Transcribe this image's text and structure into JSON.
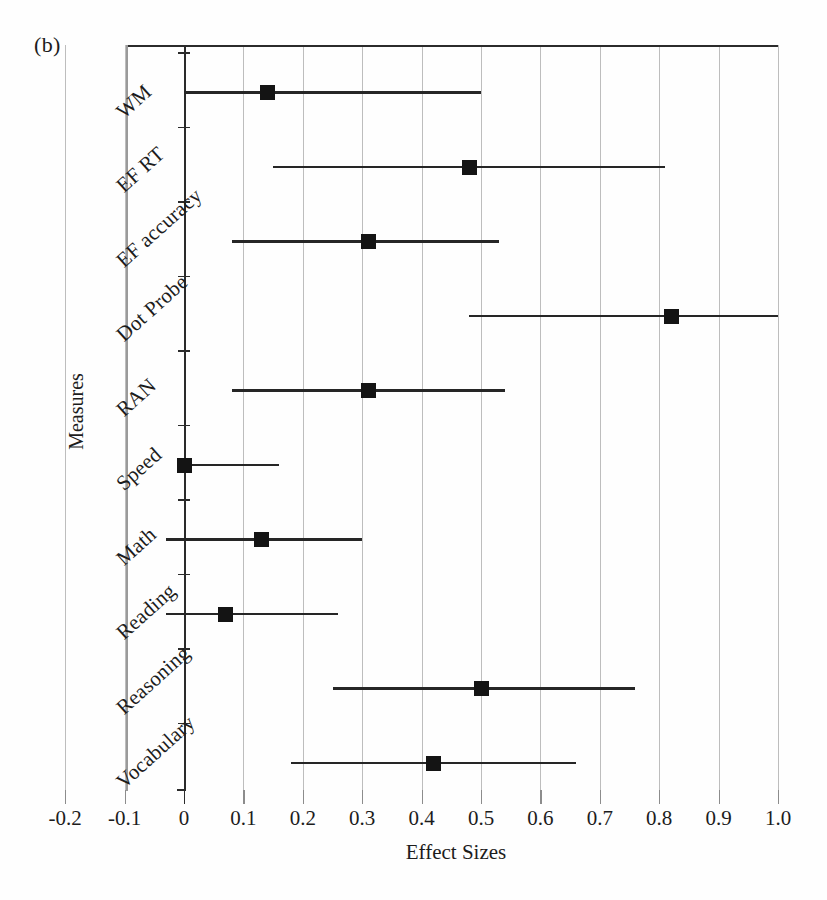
{
  "panel": {
    "label": "(b)"
  },
  "chart_data": {
    "type": "scatter",
    "subtype": "forest-plot",
    "title": "",
    "panel_label": "(b)",
    "xlabel": "Effect Sizes",
    "ylabel": "Measures",
    "xlim": [
      -0.2,
      1.0
    ],
    "ylim_categories": 10,
    "grid": true,
    "gridlines_x": [
      -0.2,
      -0.1,
      0.0,
      0.1,
      0.2,
      0.3,
      0.4,
      0.5,
      0.6,
      0.7,
      0.8,
      0.9,
      1.0
    ],
    "xticks": [
      -0.2,
      -0.1,
      0,
      0.1,
      0.2,
      0.3,
      0.4,
      0.5,
      0.6,
      0.7,
      0.8,
      0.9,
      1.0
    ],
    "xticklabels": [
      "-0.2",
      "-0.1",
      "0",
      "0.1",
      "0.2",
      "0.3",
      "0.4",
      "0.5",
      "0.6",
      "0.7",
      "0.8",
      "0.9",
      "1.0"
    ],
    "legend": "none",
    "reference_line": 0,
    "categories": [
      "WM",
      "EF RT",
      "EF accuracy",
      "Dot Probe",
      "RAN",
      "Speed",
      "Math",
      "Reading",
      "Reasoning",
      "Vocabulary"
    ],
    "effect_sizes": [
      0.14,
      0.48,
      0.31,
      0.82,
      0.31,
      0.0,
      0.13,
      0.07,
      0.5,
      0.42
    ],
    "ci_lower": [
      0.0,
      0.15,
      0.08,
      0.48,
      0.08,
      0.0,
      -0.03,
      -0.03,
      0.25,
      0.18
    ],
    "ci_upper": [
      0.5,
      0.81,
      0.53,
      1.0,
      0.54,
      0.16,
      0.3,
      0.26,
      0.76,
      0.66
    ],
    "points": [
      {
        "measure": "WM",
        "effect_size": 0.14,
        "ci_lower": 0.0,
        "ci_upper": 0.5
      },
      {
        "measure": "EF RT",
        "effect_size": 0.48,
        "ci_lower": 0.15,
        "ci_upper": 0.81
      },
      {
        "measure": "EF accuracy",
        "effect_size": 0.31,
        "ci_lower": 0.08,
        "ci_upper": 0.53
      },
      {
        "measure": "Dot Probe",
        "effect_size": 0.82,
        "ci_lower": 0.48,
        "ci_upper": 1.0
      },
      {
        "measure": "RAN",
        "effect_size": 0.31,
        "ci_lower": 0.08,
        "ci_upper": 0.54
      },
      {
        "measure": "Speed",
        "effect_size": 0.0,
        "ci_lower": 0.0,
        "ci_upper": 0.16
      },
      {
        "measure": "Math",
        "effect_size": 0.13,
        "ci_lower": -0.03,
        "ci_upper": 0.3
      },
      {
        "measure": "Reading",
        "effect_size": 0.07,
        "ci_lower": -0.03,
        "ci_upper": 0.26
      },
      {
        "measure": "Reasoning",
        "effect_size": 0.5,
        "ci_lower": 0.25,
        "ci_upper": 0.76
      },
      {
        "measure": "Vocabulary",
        "effect_size": 0.42,
        "ci_lower": 0.18,
        "ci_upper": 0.66
      }
    ],
    "marker_color": "#141414",
    "line_color": "#262626",
    "grid_color": "#bdbdbd",
    "axis_color": "#2b2b2b"
  }
}
